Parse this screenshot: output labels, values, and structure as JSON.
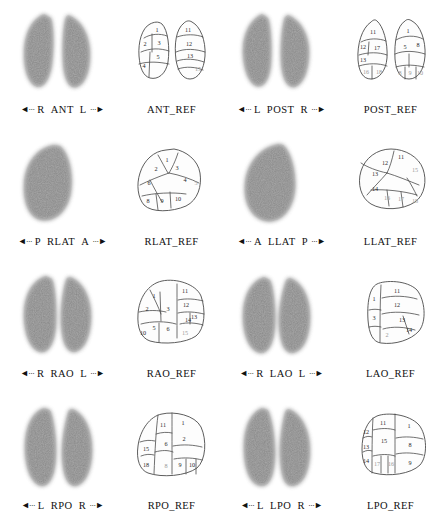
{
  "document": {
    "type": "lung-perfusion-scintigraphy-panel",
    "rows": 4,
    "columns": 2,
    "panel_count": 8
  },
  "panels": [
    {
      "id": "ant",
      "arrow_left": "◄···",
      "side_left": "R",
      "view": "ANT",
      "side_right": "L",
      "arrow_right": "···►",
      "ref_label": "ANT_REF",
      "scan_type": "two-lung",
      "segments_left_lung": [
        "1",
        "2",
        "3",
        "4",
        "5"
      ],
      "segments_right_lung": [
        "11",
        "12",
        "13",
        "15"
      ]
    },
    {
      "id": "post",
      "arrow_left": "◄···",
      "side_left": "L",
      "view": "POST",
      "side_right": "R",
      "arrow_right": "···►",
      "ref_label": "POST_REF",
      "scan_type": "two-lung",
      "segments_left_lung": [
        "11",
        "12",
        "13",
        "17",
        "16",
        "18"
      ],
      "segments_right_lung": [
        "1",
        "5",
        "8",
        "9",
        "10"
      ]
    },
    {
      "id": "rlat",
      "arrow_left": "◄···",
      "side_left": "P",
      "view": "RLAT",
      "side_right": "A",
      "arrow_right": "···►",
      "ref_label": "RLAT_REF",
      "scan_type": "single-lung",
      "segments_left_lung": [
        "1",
        "2",
        "3",
        "4",
        "5",
        "6",
        "8",
        "9",
        "10"
      ],
      "segments_right_lung": []
    },
    {
      "id": "llat",
      "arrow_left": "◄···",
      "side_left": "A",
      "view": "LLAT",
      "side_right": "P",
      "arrow_right": "···►",
      "ref_label": "LLAT_REF",
      "scan_type": "single-lung",
      "segments_left_lung": [
        "11",
        "12",
        "13",
        "14",
        "15",
        "16",
        "17",
        "18"
      ],
      "segments_right_lung": []
    },
    {
      "id": "rao",
      "arrow_left": "◄···",
      "side_left": "R",
      "view": "RAO",
      "side_right": "L",
      "arrow_right": "···►",
      "ref_label": "RAO_REF",
      "scan_type": "two-lung",
      "segments_left_lung": [
        "1",
        "2",
        "3",
        "5",
        "6",
        "10"
      ],
      "segments_right_lung": [
        "11",
        "12",
        "13",
        "14",
        "15"
      ]
    },
    {
      "id": "lao",
      "arrow_left": "◄···",
      "side_left": "R",
      "view": "LAO",
      "side_right": "L",
      "arrow_right": "···►",
      "ref_label": "LAO_REF",
      "scan_type": "two-lung",
      "segments_left_lung": [
        "1",
        "3",
        "2"
      ],
      "segments_right_lung": [
        "11",
        "12",
        "13",
        "14"
      ]
    },
    {
      "id": "rpo",
      "arrow_left": "◄···",
      "side_left": "L",
      "view": "RPO",
      "side_right": "R",
      "arrow_right": "···►",
      "ref_label": "RPO_REF",
      "scan_type": "two-lung",
      "segments_left_lung": [
        "11",
        "15",
        "18"
      ],
      "segments_right_lung": [
        "1",
        "2",
        "6",
        "8",
        "9",
        "10"
      ]
    },
    {
      "id": "lpo",
      "arrow_left": "◄···",
      "side_left": "L",
      "view": "LPO",
      "side_right": "R",
      "arrow_right": "···►",
      "ref_label": "LPO_REF",
      "scan_type": "two-lung",
      "segments_left_lung": [
        "11",
        "12",
        "13",
        "14",
        "15",
        "17",
        "16"
      ],
      "segments_right_lung": [
        "1",
        "8",
        "9"
      ]
    }
  ],
  "colors": {
    "background": "#ffffff",
    "scan_dark": "#6f6f6f",
    "outline": "#4b4b4b",
    "text": "#111111"
  }
}
